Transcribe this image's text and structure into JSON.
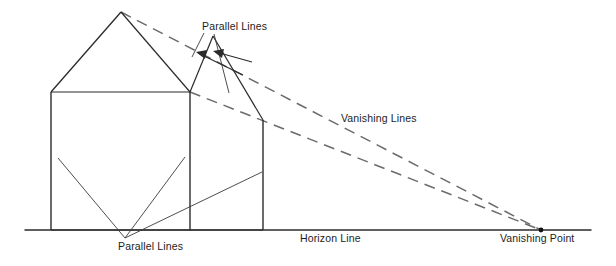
{
  "diagram": {
    "type": "perspective-drawing",
    "background_color": "#ffffff",
    "ink_color": "#2b2b2b",
    "dashed_color": "#6b6b6b",
    "labels": {
      "parallel_lines_top": "Parallel Lines",
      "parallel_lines_bottom": "Parallel Lines",
      "vanishing_lines": "Vanishing Lines",
      "horizon_line": "Horizon Line",
      "vanishing_point": "Vanishing Point"
    },
    "label_positions": {
      "parallel_lines_top": {
        "x": 202,
        "y": 21
      },
      "parallel_lines_bottom": {
        "x": 118,
        "y": 241
      },
      "vanishing_lines": {
        "x": 341,
        "y": 113
      },
      "horizon_line": {
        "x": 300,
        "y": 233
      },
      "vanishing_point": {
        "x": 500,
        "y": 233
      }
    },
    "geometry": {
      "horizon_line": {
        "x1": 25,
        "y1": 230,
        "x2": 591,
        "y2": 230
      },
      "vanishing_point": {
        "x": 541,
        "y": 230,
        "radius": 2.4
      },
      "front_facade": {
        "left_wall": {
          "x1": 51,
          "y1": 92,
          "x2": 51,
          "y2": 230
        },
        "right_wall": {
          "x1": 190,
          "y1": 92,
          "x2": 190,
          "y2": 230
        },
        "eave_line": {
          "x1": 51,
          "y1": 92,
          "x2": 190,
          "y2": 92
        }
      },
      "front_gable": {
        "apex": {
          "x": 121,
          "y": 12
        },
        "left_eave": {
          "x": 51,
          "y": 92
        },
        "right_eave": {
          "x": 190,
          "y": 92
        }
      },
      "side_gable": {
        "apex": {
          "x": 213,
          "y": 36
        },
        "near_eave": {
          "x": 190,
          "y": 92
        },
        "far_eave": {
          "x": 263,
          "y": 120
        }
      },
      "side_wall": {
        "right_corner": {
          "x1": 263,
          "y1": 120,
          "x2": 263,
          "y2": 230
        },
        "base_line": {
          "x1": 190,
          "y1": 230,
          "x2": 263,
          "y2": 230
        }
      },
      "vanishing_rays": [
        {
          "from": {
            "x": 121,
            "y": 12
          },
          "to": {
            "x": 541,
            "y": 230
          },
          "style": "dashed"
        },
        {
          "from": {
            "x": 190,
            "y": 92
          },
          "to": {
            "x": 541,
            "y": 230
          },
          "style": "dashed"
        }
      ],
      "leaders_top": [
        {
          "from": {
            "x": 204,
            "y": 33
          },
          "to": {
            "x": 192,
            "y": 57
          }
        },
        {
          "from": {
            "x": 214,
            "y": 34
          },
          "to": {
            "x": 229,
            "y": 93
          }
        }
      ],
      "top_arrows": [
        {
          "from": {
            "x": 243,
            "y": 75
          },
          "to": {
            "x": 196,
            "y": 52
          }
        },
        {
          "from": {
            "x": 249,
            "y": 62
          },
          "to": {
            "x": 213,
            "y": 52
          }
        }
      ],
      "leaders_bottom": [
        {
          "from": {
            "x": 125,
            "y": 238
          },
          "to": {
            "x": 58,
            "y": 158
          }
        },
        {
          "from": {
            "x": 125,
            "y": 238
          },
          "to": {
            "x": 185,
            "y": 157
          }
        },
        {
          "from": {
            "x": 125,
            "y": 238
          },
          "to": {
            "x": 262,
            "y": 172
          }
        }
      ]
    }
  }
}
